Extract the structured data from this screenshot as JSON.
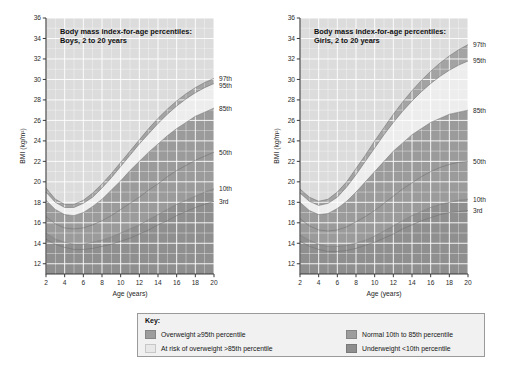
{
  "chart_data": [
    {
      "type": "line",
      "title": "Body mass index-for-age percentiles:\nBoys, 2 to 20 years",
      "title_line1": "Body mass index-for-age percentiles:",
      "title_line2": "Boys, 2 to 20 years",
      "xlabel": "Age (years)",
      "ylabel": "BMI (kg/m²)",
      "xlim": [
        2,
        20
      ],
      "ylim": [
        11,
        36
      ],
      "xticks": [
        2,
        4,
        6,
        8,
        10,
        12,
        14,
        16,
        18,
        20
      ],
      "yticks": [
        12,
        14,
        16,
        18,
        20,
        22,
        24,
        26,
        28,
        30,
        32,
        34,
        36
      ],
      "grid": true,
      "legend_position": "right-outside",
      "x": [
        2,
        3,
        4,
        5,
        6,
        7,
        8,
        9,
        10,
        11,
        12,
        13,
        14,
        15,
        16,
        17,
        18,
        19,
        20
      ],
      "series": [
        {
          "name": "97th",
          "values": [
            19.4,
            18.3,
            17.8,
            17.8,
            18.2,
            18.9,
            19.8,
            20.8,
            21.9,
            23.0,
            24.1,
            25.2,
            26.2,
            27.1,
            27.9,
            28.6,
            29.2,
            29.7,
            30.1
          ]
        },
        {
          "name": "95th",
          "values": [
            19.0,
            18.0,
            17.5,
            17.5,
            17.9,
            18.5,
            19.4,
            20.4,
            21.5,
            22.6,
            23.7,
            24.7,
            25.7,
            26.6,
            27.4,
            28.1,
            28.7,
            29.2,
            29.6
          ]
        },
        {
          "name": "85th",
          "values": [
            18.2,
            17.3,
            16.8,
            16.7,
            17.0,
            17.6,
            18.3,
            19.2,
            20.1,
            21.1,
            22.0,
            22.9,
            23.7,
            24.5,
            25.2,
            25.8,
            26.4,
            26.8,
            27.2
          ]
        },
        {
          "name": "50th",
          "values": [
            16.6,
            15.9,
            15.5,
            15.4,
            15.5,
            15.8,
            16.2,
            16.7,
            17.3,
            17.9,
            18.5,
            19.2,
            19.8,
            20.5,
            21.1,
            21.6,
            22.1,
            22.5,
            22.9
          ]
        },
        {
          "name": "10th",
          "values": [
            15.0,
            14.4,
            14.1,
            13.9,
            13.9,
            14.1,
            14.3,
            14.6,
            15.0,
            15.4,
            15.8,
            16.3,
            16.8,
            17.3,
            17.8,
            18.2,
            18.6,
            19.0,
            19.3
          ]
        },
        {
          "name": "3rd",
          "values": [
            14.4,
            13.9,
            13.6,
            13.4,
            13.4,
            13.5,
            13.7,
            13.9,
            14.2,
            14.5,
            14.9,
            15.3,
            15.8,
            16.2,
            16.7,
            17.1,
            17.5,
            17.8,
            18.1
          ]
        }
      ],
      "percentile_labels": [
        "97th",
        "95th",
        "85th",
        "50th",
        "10th",
        "3rd"
      ]
    },
    {
      "type": "line",
      "title": "Body mass index-for-age percentiles:\nGirls, 2 to 20 years",
      "title_line1": "Body mass index-for-age percentiles:",
      "title_line2": "Girls, 2 to 20 years",
      "xlabel": "Age (years)",
      "ylabel": "BMI (kg/m²)",
      "xlim": [
        2,
        20
      ],
      "ylim": [
        11,
        36
      ],
      "xticks": [
        2,
        4,
        6,
        8,
        10,
        12,
        14,
        16,
        18,
        20
      ],
      "yticks": [
        12,
        14,
        16,
        18,
        20,
        22,
        24,
        26,
        28,
        30,
        32,
        34,
        36
      ],
      "grid": true,
      "legend_position": "right-outside",
      "x": [
        2,
        3,
        4,
        5,
        6,
        7,
        8,
        9,
        10,
        11,
        12,
        13,
        14,
        15,
        16,
        17,
        18,
        19,
        20
      ],
      "series": [
        {
          "name": "97th",
          "values": [
            19.3,
            18.5,
            18.1,
            18.3,
            19.0,
            20.0,
            21.3,
            22.6,
            24.0,
            25.3,
            26.6,
            27.8,
            28.9,
            29.9,
            30.8,
            31.6,
            32.3,
            32.9,
            33.4
          ]
        },
        {
          "name": "95th",
          "values": [
            18.9,
            18.1,
            17.7,
            17.9,
            18.5,
            19.5,
            20.7,
            22.0,
            23.3,
            24.6,
            25.8,
            26.9,
            27.9,
            28.8,
            29.6,
            30.3,
            30.9,
            31.4,
            31.8
          ]
        },
        {
          "name": "85th",
          "values": [
            18.0,
            17.2,
            16.8,
            16.9,
            17.4,
            18.1,
            19.0,
            20.0,
            21.0,
            22.0,
            23.0,
            23.8,
            24.6,
            25.2,
            25.8,
            26.2,
            26.6,
            26.8,
            27.0
          ]
        },
        {
          "name": "50th",
          "values": [
            16.4,
            15.7,
            15.3,
            15.2,
            15.3,
            15.6,
            16.1,
            16.6,
            17.2,
            17.9,
            18.6,
            19.3,
            19.9,
            20.5,
            21.0,
            21.4,
            21.7,
            21.9,
            22.0
          ]
        },
        {
          "name": "10th",
          "values": [
            14.8,
            14.3,
            13.9,
            13.7,
            13.7,
            13.8,
            14.0,
            14.3,
            14.7,
            15.2,
            15.7,
            16.2,
            16.7,
            17.1,
            17.5,
            17.8,
            18.0,
            18.2,
            18.3
          ]
        },
        {
          "name": "3rd",
          "values": [
            14.2,
            13.7,
            13.4,
            13.2,
            13.2,
            13.3,
            13.5,
            13.8,
            14.1,
            14.5,
            14.9,
            15.4,
            15.8,
            16.2,
            16.5,
            16.8,
            17.0,
            17.1,
            17.2
          ]
        }
      ],
      "percentile_labels": [
        "97th",
        "95th",
        "85th",
        "50th",
        "10th",
        "3rd"
      ]
    }
  ],
  "key": {
    "title": "Key:",
    "items_col1": [
      {
        "label": "Overweight ≥95th percentile",
        "color": "#9d9d9d"
      },
      {
        "label": "At risk of overweight >85th percentile",
        "color": "#e8e8e8"
      }
    ],
    "items_col2": [
      {
        "label": "Normal 10th to 85th percentile",
        "color": "#9d9d9d"
      },
      {
        "label": "Underweight <10th percentile",
        "color": "#8e8e8e"
      }
    ]
  },
  "colors": {
    "plot_background": "#dcdcdc",
    "band_overweight": "#a3a3a3",
    "band_at_risk": "#ededed",
    "band_normal": "#9b9b9b",
    "band_underweight": "#8f8f8f",
    "gridline": "#ffffff",
    "axis": "#3a3a3a",
    "key_background": "#f1f1f1",
    "key_border": "#9a9a9a"
  }
}
